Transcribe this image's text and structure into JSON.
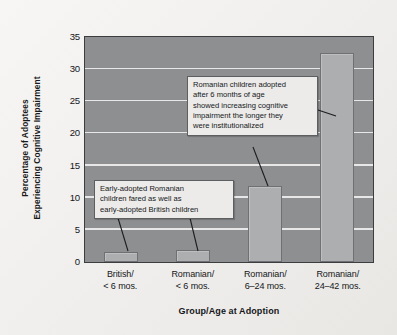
{
  "chart_data": {
    "type": "bar",
    "title": "",
    "xlabel": "Group/Age at Adoption",
    "ylabel": "Percentage of Adoptees Experiencing Cognitive Impairment",
    "ylabel_lines": [
      "Percentage of Adoptees",
      "Experiencing Cognitive Impairment"
    ],
    "categories": [
      "British/\n< 6 mos.",
      "Romanian/\n< 6 mos.",
      "Romanian/\n6–24 mos.",
      "Romanian/\n24–42 mos."
    ],
    "category_lines": [
      [
        "British/",
        "< 6 mos."
      ],
      [
        "Romanian/",
        "< 6 mos."
      ],
      [
        "Romanian/",
        "6–24 mos."
      ],
      [
        "Romanian/",
        "24–42 mos."
      ]
    ],
    "values": [
      1.6,
      1.9,
      11.8,
      32.5
    ],
    "ylim": [
      0,
      35
    ],
    "yticks": [
      0,
      5,
      10,
      15,
      20,
      25,
      30,
      35
    ],
    "ytick_labels": [
      "0",
      "5",
      "10",
      "15",
      "20",
      "25",
      "30",
      "35"
    ],
    "grid": true,
    "grid_axis": "y",
    "legend": "none",
    "annotations": [
      {
        "name": "early-adoption-note",
        "lines": [
          "Early-adopted Romanian",
          "children fared as well as",
          "early-adopted British children"
        ],
        "points_to": [
          "British/ < 6 mos. bar",
          "Romanian/ < 6 mos. bar"
        ]
      },
      {
        "name": "late-adoption-note",
        "lines": [
          "Romanian children adopted",
          "after 6 months of age",
          "showed increasing cognitive",
          "impairment the longer they",
          "were institutionalized"
        ],
        "points_to": [
          "Romanian/ 6–24 mos. bar",
          "Romanian/ 24–42 mos. bar"
        ]
      }
    ]
  },
  "colors": {
    "figure_background": "#f2f1ef",
    "plot_background": "#8e8f90",
    "bar_fill": "#adaeaf",
    "bar_edge": "#6f7073",
    "gridline": "#efefef",
    "axis_frame": "#3c3d40",
    "callout_background": "#ecebe9",
    "callout_border": "#5d5e60",
    "text": "#15161a"
  }
}
